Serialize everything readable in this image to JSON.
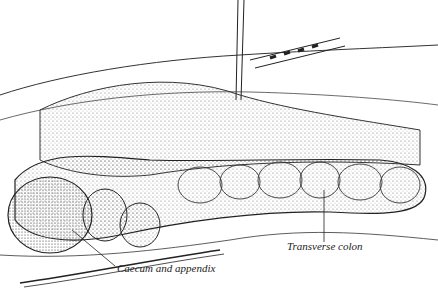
{
  "figure": {
    "labels": [
      {
        "id": "caecum",
        "text": "Caecum and appendix",
        "x": 117,
        "y": 270
      },
      {
        "id": "transverse",
        "text": "Transverse colon",
        "x": 287,
        "y": 246
      }
    ]
  }
}
